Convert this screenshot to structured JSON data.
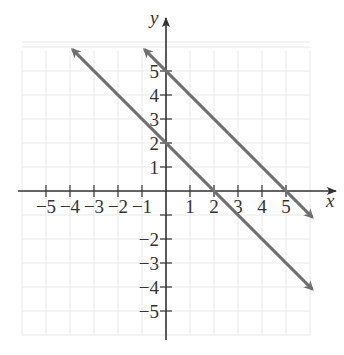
{
  "chart_data": {
    "type": "line",
    "title": "",
    "xlabel": "x",
    "ylabel": "y",
    "xlim": [
      -6,
      6
    ],
    "ylim": [
      -6,
      6
    ],
    "grid": true,
    "x_ticks": [
      -5,
      -4,
      -3,
      -2,
      -1,
      1,
      2,
      3,
      4,
      5
    ],
    "x_tick_labels": [
      "−5",
      "−4",
      "−3",
      "−2",
      "−1",
      "1",
      "2",
      "3",
      "4",
      "5"
    ],
    "y_ticks": [
      -5,
      -4,
      -3,
      -2,
      -1,
      1,
      2,
      3,
      4,
      5
    ],
    "y_tick_labels": [
      "−5",
      "−4",
      "−3",
      "−2",
      "",
      "1",
      "2",
      "3",
      "4",
      "5"
    ],
    "series": [
      {
        "name": "y = -x + 2",
        "equation": "y = -x + 2",
        "slope": -1,
        "intercept": 2,
        "x": [
          -3.9,
          6.1
        ],
        "y": [
          5.9,
          -4.1
        ],
        "arrows": "both",
        "color": "#707070"
      },
      {
        "name": "y = -x + 5",
        "equation": "y = -x + 5",
        "slope": -1,
        "intercept": 5,
        "x": [
          -0.9,
          6.1
        ],
        "y": [
          5.9,
          -1.1
        ],
        "arrows": "both",
        "color": "#707070"
      }
    ]
  },
  "style": {
    "axis_color": "#333333",
    "grid_color": "#e8e8e8",
    "line_color": "#707070"
  }
}
